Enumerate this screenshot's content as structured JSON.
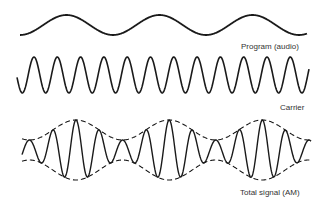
{
  "labels": {
    "program": "Program  (audio)",
    "carrier": "Carrier",
    "total": "Total signal (AM)"
  },
  "waves": {
    "program": {
      "x_start": 20,
      "x_end": 307,
      "center_y": 25,
      "amplitude": 10,
      "period": 93,
      "phase": "trough-start"
    },
    "carrier": {
      "x_start": 17,
      "x_end": 309,
      "center_y": 75,
      "amplitude": 18,
      "period": 23.3,
      "first_peak_x": 34
    },
    "am": {
      "x_start": 22,
      "x_end": 311,
      "center_y": 150,
      "env_min": 10,
      "env_max": 30,
      "mod_period": 93,
      "first_env_max_x": 76,
      "carrier_period": 23.3
    }
  },
  "colors": {
    "stroke": "#1a1a1a",
    "label": "#333333",
    "background": "#ffffff"
  }
}
